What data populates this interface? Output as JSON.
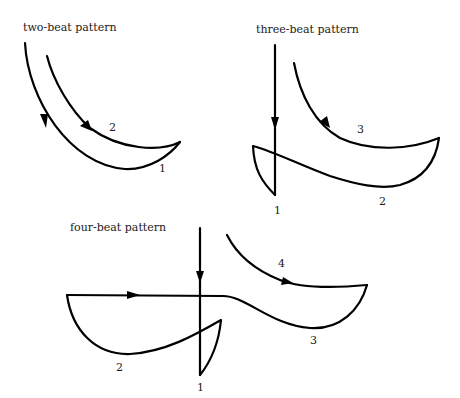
{
  "diagram": {
    "panels": [
      {
        "id": "two-beat",
        "title": "two-beat pattern",
        "beats": [
          "1",
          "2"
        ]
      },
      {
        "id": "three-beat",
        "title": "three-beat pattern",
        "beats": [
          "1",
          "2",
          "3"
        ]
      },
      {
        "id": "four-beat",
        "title": "four-beat pattern",
        "beats": [
          "1",
          "2",
          "3",
          "4"
        ]
      }
    ],
    "colors": {
      "line": "#000000",
      "text": "#1a1a1a",
      "background": "#ffffff"
    }
  }
}
